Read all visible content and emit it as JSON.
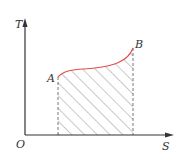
{
  "diagram": {
    "type": "T-S diagram",
    "axes": {
      "y_label": "T",
      "x_label": "S",
      "origin_label": "O"
    },
    "points": [
      {
        "label": "A"
      },
      {
        "label": "B"
      }
    ],
    "curve_color": "#e0504a",
    "axis_color": "#333333",
    "hatch_color": "#666666"
  }
}
